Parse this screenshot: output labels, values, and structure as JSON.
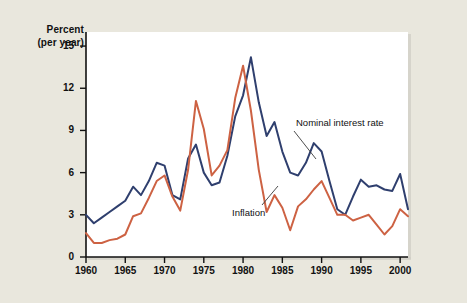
{
  "chart_data": {
    "type": "line",
    "title": "",
    "subtitle": "",
    "xlabel": "",
    "ylabel": "Percent (per year)",
    "ylabel_line1": "Percent",
    "ylabel_line2": "(per year)",
    "xlim": [
      1960,
      2001
    ],
    "ylim": [
      0,
      16
    ],
    "yticks": [
      0,
      3,
      6,
      9,
      12,
      15
    ],
    "ytick_labels": [
      "0",
      "3",
      "6",
      "9",
      "12",
      "15"
    ],
    "xticks": [
      1960,
      1965,
      1970,
      1975,
      1980,
      1985,
      1990,
      1995,
      2000
    ],
    "xtick_labels": [
      "1960",
      "1965",
      "1970",
      "1975",
      "1980",
      "1985",
      "1990",
      "1995",
      "2000"
    ],
    "grid": false,
    "legend_position": "inline-annotations",
    "x": [
      1960,
      1961,
      1962,
      1963,
      1964,
      1965,
      1966,
      1967,
      1968,
      1969,
      1970,
      1971,
      1972,
      1973,
      1974,
      1975,
      1976,
      1977,
      1978,
      1979,
      1980,
      1981,
      1982,
      1983,
      1984,
      1985,
      1986,
      1987,
      1988,
      1989,
      1990,
      1991,
      1992,
      1993,
      1994,
      1995,
      1996,
      1997,
      1998,
      1999,
      2000,
      2001
    ],
    "series": [
      {
        "name": "Nominal interest rate",
        "color": "#2f3f6e",
        "values": [
          3.0,
          2.4,
          2.8,
          3.2,
          3.6,
          4.0,
          5.0,
          4.4,
          5.4,
          6.7,
          6.5,
          4.4,
          4.1,
          7.0,
          8.0,
          6.0,
          5.1,
          5.3,
          7.2,
          10.0,
          11.5,
          14.2,
          11.0,
          8.6,
          9.6,
          7.5,
          6.0,
          5.8,
          6.7,
          8.1,
          7.5,
          5.4,
          3.4,
          3.0,
          4.3,
          5.5,
          5.0,
          5.1,
          4.8,
          4.7,
          5.9,
          3.4
        ]
      },
      {
        "name": "Inflation",
        "color": "#cd6243",
        "values": [
          1.7,
          1.0,
          1.0,
          1.2,
          1.3,
          1.6,
          2.9,
          3.1,
          4.2,
          5.4,
          5.8,
          4.3,
          3.3,
          6.2,
          11.1,
          9.1,
          5.8,
          6.5,
          7.6,
          11.3,
          13.6,
          10.4,
          6.2,
          3.2,
          4.4,
          3.5,
          1.9,
          3.6,
          4.1,
          4.8,
          5.4,
          4.2,
          3.0,
          3.0,
          2.6,
          2.8,
          3.0,
          2.3,
          1.6,
          2.2,
          3.4,
          2.9
        ]
      }
    ],
    "annotations": [
      {
        "text": "Nominal interest rate",
        "points_to_series": "Nominal interest rate",
        "points_to_year": 1986
      },
      {
        "text": "Inflation",
        "points_to_series": "Inflation",
        "points_to_year": 1982
      }
    ]
  },
  "colors": {
    "background": "#e9e7dd",
    "plot_background": "#ffffff",
    "axis": "#111111",
    "nominal_interest_rate": "#2f3f6e",
    "inflation": "#cd6243"
  }
}
